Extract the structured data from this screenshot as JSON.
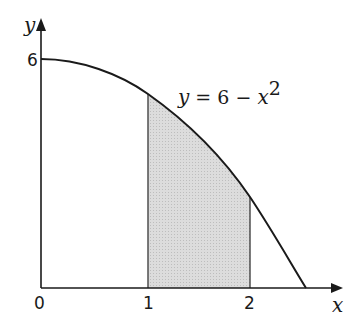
{
  "diagram": {
    "type": "area-under-curve",
    "curve_equation": "y = 6 − x²",
    "equation_parts": {
      "y": "y",
      "eq": " = 6 − ",
      "x": "x",
      "exp": "2"
    },
    "axes": {
      "x_label": "x",
      "y_label": "y",
      "origin_label": "0",
      "x_ticks": [
        "1",
        "2"
      ],
      "y_ticks": [
        "6"
      ]
    },
    "shaded_region": {
      "from_x": 1,
      "to_x": 2,
      "fill": "#d9d9d9"
    },
    "colors": {
      "line": "#1a1a1a",
      "shade": "#d9d9d9",
      "shade_edge": "#555555"
    }
  }
}
